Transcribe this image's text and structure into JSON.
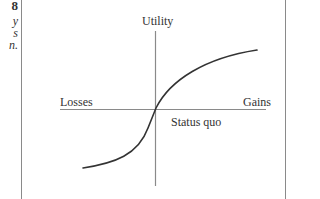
{
  "margin_fragments": [
    {
      "text": "8",
      "style": "bold",
      "top": 0
    },
    {
      "text": "y",
      "style": "italic",
      "top": 15
    },
    {
      "text": "s",
      "style": "italic",
      "top": 27
    },
    {
      "text": "n.",
      "style": "italic",
      "top": 39
    }
  ],
  "diagram": {
    "y_axis_label": "Utility",
    "x_axis_negative_label": "Losses",
    "x_axis_positive_label": "Gains",
    "origin_label": "Status quo",
    "curve": "S-shaped value function: concave for gains, convex and steeper for losses",
    "colors": {
      "axis": "#8a8a8a",
      "curve": "#333333",
      "frame": "#8a8a8a",
      "text": "#333333"
    }
  }
}
